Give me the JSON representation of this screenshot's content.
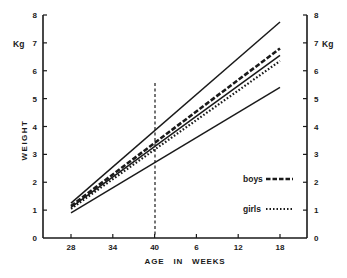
{
  "chart_data": {
    "type": "line",
    "title": "",
    "xlabel": "AGE   IN   WEEKS",
    "ylabel": "WEIGHT",
    "y_unit_label": "Kg",
    "x_categories": [
      "28",
      "34",
      "40",
      "6",
      "12",
      "18"
    ],
    "x_note": "28-40 are gestational weeks; 6-18 are weeks after term (40)",
    "yticks": [
      "0",
      "1",
      "2",
      "3",
      "4",
      "5",
      "6",
      "7",
      "8"
    ],
    "ylim": [
      0,
      8
    ],
    "grid": false,
    "secondary_y_axis": true,
    "reference_line": {
      "x": "40",
      "style": "dashed",
      "orientation": "vertical"
    },
    "legend_position": "lower right",
    "series": [
      {
        "name": "upper limit",
        "style": "solid",
        "legend": false,
        "start": 1.25,
        "end": 7.75
      },
      {
        "name": "boys",
        "style": "dashed",
        "legend": true,
        "start": 1.15,
        "end": 6.8
      },
      {
        "name": "mean",
        "style": "solid",
        "legend": false,
        "start": 1.1,
        "end": 6.55
      },
      {
        "name": "girls",
        "style": "dotted",
        "legend": true,
        "start": 1.05,
        "end": 6.35
      },
      {
        "name": "lower limit",
        "style": "solid",
        "legend": false,
        "start": 0.9,
        "end": 5.4
      }
    ]
  },
  "legend": {
    "boys": "boys",
    "girls": "girls"
  },
  "axis": {
    "left_unit": "Kg",
    "right_unit": "Kg",
    "ylabel": "WEIGHT",
    "xlabel": "AGE   IN   WEEKS"
  },
  "colors": {
    "ink": "#1a1a1a",
    "background": "#ffffff"
  }
}
